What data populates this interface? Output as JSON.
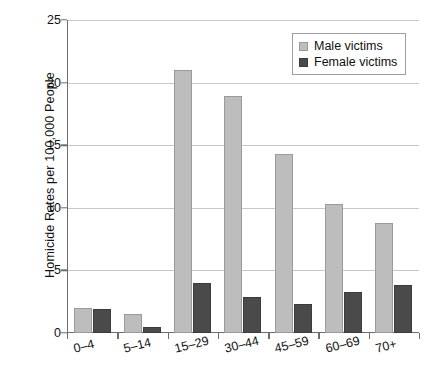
{
  "chart_data": {
    "type": "bar",
    "title": "",
    "xlabel": "",
    "ylabel": "Homicide Rates per 100,000 People",
    "categories": [
      "0–4",
      "5–14",
      "15–29",
      "30–44",
      "45–59",
      "60–69",
      "70+"
    ],
    "series": [
      {
        "name": "Male victims",
        "color": "#bdbdbd",
        "values": [
          2.0,
          1.5,
          21.0,
          18.9,
          14.3,
          10.3,
          8.8
        ]
      },
      {
        "name": "Female victims",
        "color": "#4a4a4a",
        "values": [
          1.9,
          0.5,
          4.0,
          2.9,
          2.3,
          3.3,
          3.8
        ]
      }
    ],
    "ylim": [
      0,
      25
    ],
    "yticks": [
      0,
      5,
      10,
      15,
      20,
      25
    ],
    "ytick_labels": [
      "0",
      "5",
      "10",
      "15",
      "20",
      "25"
    ],
    "grid": true,
    "legend_position": "top-right"
  },
  "legend": {
    "entries": [
      {
        "label": "Male victims",
        "swatch": "male-swatch"
      },
      {
        "label": "Female victims",
        "swatch": "female-swatch"
      }
    ]
  },
  "axis": {
    "y_title": "Homicide Rates per 100,000 People"
  }
}
